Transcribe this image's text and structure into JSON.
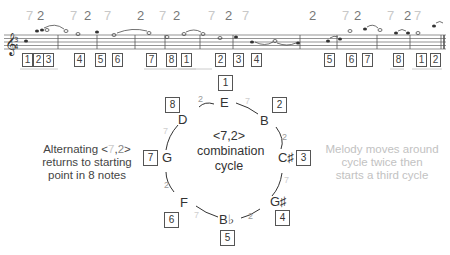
{
  "staff": {
    "interval_labels": [
      {
        "text": "7",
        "x": 26,
        "kind": "7"
      },
      {
        "text": "2",
        "x": 37,
        "kind": "2"
      },
      {
        "text": "7",
        "x": 70,
        "kind": "7"
      },
      {
        "text": "2",
        "x": 84,
        "kind": "2"
      },
      {
        "text": "7",
        "x": 104,
        "kind": "7"
      },
      {
        "text": "2",
        "x": 137,
        "kind": "2"
      },
      {
        "text": "7",
        "x": 159,
        "kind": "7"
      },
      {
        "text": "2",
        "x": 173,
        "kind": "2"
      },
      {
        "text": "7",
        "x": 208,
        "kind": "7"
      },
      {
        "text": "2",
        "x": 225,
        "kind": "2"
      },
      {
        "text": "7",
        "x": 242,
        "kind": "7"
      },
      {
        "text": "2",
        "x": 309,
        "kind": "2"
      },
      {
        "text": "7",
        "x": 342,
        "kind": "7"
      },
      {
        "text": "2",
        "x": 354,
        "kind": "2"
      },
      {
        "text": "7",
        "x": 387,
        "kind": "7"
      },
      {
        "text": "2",
        "x": 404,
        "kind": "2"
      },
      {
        "text": "7",
        "x": 414,
        "kind": "7"
      }
    ],
    "position_numbers": [
      {
        "text": "1",
        "x": 22
      },
      {
        "text": "2",
        "x": 33
      },
      {
        "text": "3",
        "x": 43
      },
      {
        "text": "4",
        "x": 74
      },
      {
        "text": "5",
        "x": 95
      },
      {
        "text": "6",
        "x": 112
      },
      {
        "text": "7",
        "x": 146
      },
      {
        "text": "8",
        "x": 166
      },
      {
        "text": "1",
        "x": 181
      },
      {
        "text": "2",
        "x": 215
      },
      {
        "text": "3",
        "x": 233
      },
      {
        "text": "4",
        "x": 251
      },
      {
        "text": "5",
        "x": 324
      },
      {
        "text": "6",
        "x": 346
      },
      {
        "text": "7",
        "x": 362
      },
      {
        "text": "8",
        "x": 393
      },
      {
        "text": "1",
        "x": 416
      },
      {
        "text": "2",
        "x": 430
      }
    ]
  },
  "cycle": {
    "title_line1": "<7,2>",
    "title_line2": "combination",
    "title_line3": "cycle",
    "nodes": [
      {
        "note": "E",
        "position": "1"
      },
      {
        "note": "B",
        "position": "2"
      },
      {
        "note": "C♯",
        "position": "3"
      },
      {
        "note": "G♯",
        "position": "4"
      },
      {
        "note": "B♭",
        "position": "5"
      },
      {
        "note": "F",
        "position": "6"
      },
      {
        "note": "G",
        "position": "7"
      },
      {
        "note": "D",
        "position": "8"
      }
    ],
    "arc_labels": [
      {
        "text": "7",
        "between": "E-B"
      },
      {
        "text": "2",
        "between": "B-C♯"
      },
      {
        "text": "7",
        "between": "C♯-G♯"
      },
      {
        "text": "2",
        "between": "G♯-B♭"
      },
      {
        "text": "7",
        "between": "B♭-F"
      },
      {
        "text": "2",
        "between": "F-G"
      },
      {
        "text": "7",
        "between": "G-D"
      },
      {
        "text": "2",
        "between": "D-E"
      }
    ]
  },
  "annotations": {
    "left": {
      "line1_prefix": "Alternating <",
      "line1_seven": "7",
      "line1_comma": ",",
      "line1_two": "2",
      "line1_suffix": ">",
      "line2": "returns to starting",
      "line3": "point in 8 notes"
    },
    "right": {
      "line1": "Melody moves around",
      "line2": "cycle twice then",
      "line3": "starts a third cycle"
    }
  },
  "colors": {
    "interval_7": "#c8c8c8",
    "interval_2": "#777777",
    "ink": "#333333"
  }
}
